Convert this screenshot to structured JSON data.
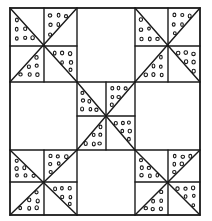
{
  "diagram": {
    "type": "quilt-block-pattern",
    "colors": {
      "ink": "#1a1a1a",
      "background": "#ffffff"
    },
    "layout": {
      "block_rows": 3,
      "block_cols": 3,
      "blocks": [
        [
          "pinwheel",
          "plain",
          "pinwheel"
        ],
        [
          "plain",
          "pinwheel",
          "plain"
        ],
        [
          "pinwheel",
          "plain",
          "pinwheel"
        ]
      ]
    },
    "pinwheel": {
      "cells": 4,
      "dotted_triangles": [
        "top-left-cell-lower",
        "top-right-cell-upper",
        "bottom-left-cell-lower",
        "bottom-right-cell-upper"
      ],
      "fill_pattern": "dots"
    }
  }
}
